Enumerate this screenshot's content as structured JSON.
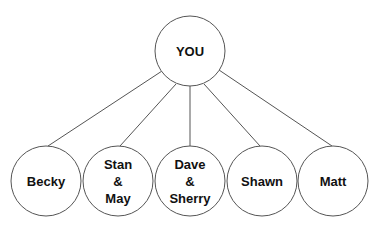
{
  "diagram": {
    "type": "hierarchy",
    "colors": {
      "stroke": "#555555",
      "text": "#111111",
      "background": "#ffffff"
    },
    "root": {
      "label": "YOU",
      "cx": 190,
      "cy": 51,
      "r": 35
    },
    "children": [
      {
        "label": "Becky",
        "cx": 46,
        "cy": 181,
        "r": 35
      },
      {
        "label": "Stan\n&\nMay",
        "cx": 118,
        "cy": 181,
        "r": 35
      },
      {
        "label": "Dave\n&\nSherry",
        "cx": 190,
        "cy": 181,
        "r": 35
      },
      {
        "label": "Shawn",
        "cx": 262,
        "cy": 181,
        "r": 35
      },
      {
        "label": "Matt",
        "cx": 333,
        "cy": 181,
        "r": 35
      }
    ],
    "edges": [
      {
        "from": "YOU",
        "to": "Becky"
      },
      {
        "from": "YOU",
        "to": "Stan & May"
      },
      {
        "from": "YOU",
        "to": "Dave & Sherry"
      },
      {
        "from": "YOU",
        "to": "Shawn"
      },
      {
        "from": "YOU",
        "to": "Matt"
      }
    ]
  }
}
